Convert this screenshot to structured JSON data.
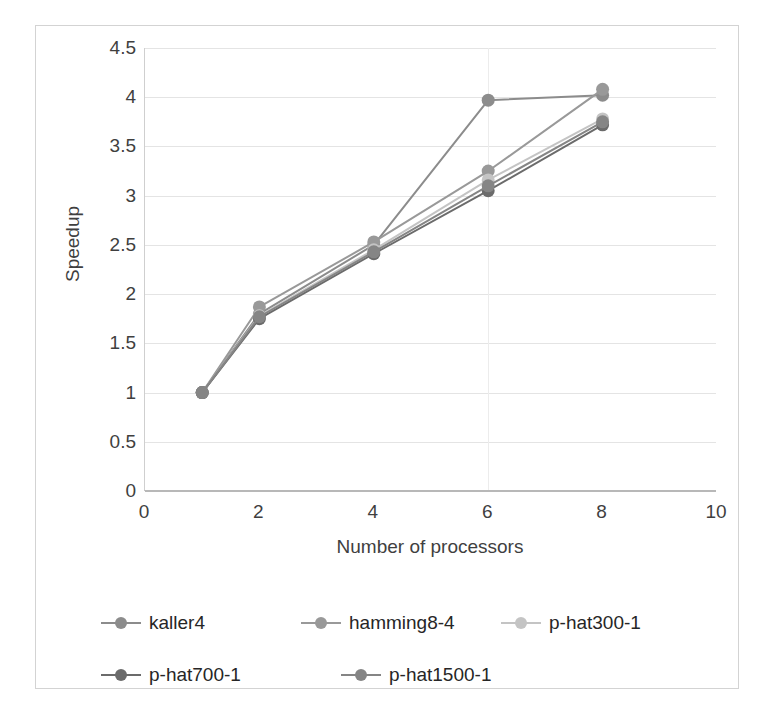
{
  "chart_data": {
    "type": "line",
    "title": "",
    "xlabel": "Number of processors",
    "ylabel": "Speedup",
    "xlim": [
      0,
      10
    ],
    "ylim": [
      0,
      4.5
    ],
    "x_ticks": [
      "0",
      "2",
      "4",
      "6",
      "8",
      "10"
    ],
    "x_tick_values": [
      0,
      2,
      4,
      6,
      8,
      10
    ],
    "y_ticks": [
      "0",
      "0.5",
      "1",
      "1.5",
      "2",
      "2.5",
      "3",
      "3.5",
      "4",
      "4.5"
    ],
    "y_tick_values": [
      0,
      0.5,
      1,
      1.5,
      2,
      2.5,
      3,
      3.5,
      4,
      4.5
    ],
    "grid": "horizontal",
    "legend_position": "bottom",
    "x": [
      1,
      2,
      4,
      6,
      8
    ],
    "series": [
      {
        "name": "kaller4",
        "color": "#8c8c8c",
        "values": [
          1.0,
          1.8,
          2.5,
          3.97,
          4.02
        ]
      },
      {
        "name": "hamming8-4",
        "color": "#999999",
        "values": [
          1.0,
          1.87,
          2.53,
          3.25,
          4.08
        ]
      },
      {
        "name": "p-hat300-1",
        "color": "#c4c4c4",
        "values": [
          1.0,
          1.78,
          2.45,
          3.16,
          3.78
        ]
      },
      {
        "name": "p-hat700-1",
        "color": "#6b6b6b",
        "values": [
          1.0,
          1.75,
          2.41,
          3.05,
          3.72
        ]
      },
      {
        "name": "p-hat1500-1",
        "color": "#858585",
        "values": [
          1.0,
          1.77,
          2.43,
          3.1,
          3.75
        ]
      }
    ]
  },
  "colors": {
    "frame_border": "#d3d3d3",
    "gridline": "#e4e4e4",
    "axis_line": "#b8b8b8",
    "tick_text": "#3f3f3f",
    "legend_text": "#262626",
    "background": "#ffffff"
  }
}
